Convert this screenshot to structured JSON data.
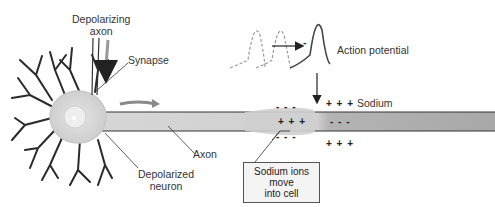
{
  "labels": {
    "depolarizing_axon": [
      "Depolarizing",
      "axon"
    ],
    "synapse": "Synapse",
    "axon": "Axon",
    "depolarized_neuron": [
      "Depolarized",
      "neuron"
    ],
    "action_potential": "Action potential",
    "sodium": "Sodium",
    "callout": [
      "Sodium ions",
      "move",
      "into cell"
    ],
    "ap_minus": "-"
  },
  "charges": {
    "outside_top_left": "- - -",
    "inside_left": "+ + +",
    "outside_bottom_left": "- - -",
    "outside_top_right": "+ + +",
    "inside_right": "- - -",
    "outside_bottom_right": "+ + +"
  },
  "colors": {
    "axon_fill": "#c9c9c9",
    "axon_dark": "#a9a9a9",
    "soma_fill": "#d8d8d8",
    "nucleus": "#eeeeee",
    "outline": "#333333",
    "arrow_gray": "#8a8a8a"
  }
}
